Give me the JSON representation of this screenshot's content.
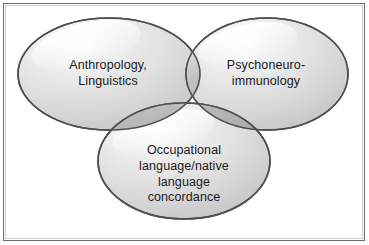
{
  "figure": {
    "type": "venn-diagram-3-set",
    "background_color": "#ffffff",
    "border_color": "#6e6e6e",
    "text_color": "#1a1a1a",
    "fill_light": "#e2e2e2",
    "fill_mid": "#c9c9c9",
    "fill_dark": "#9a9a9a",
    "outline_color": "#4a4a4a",
    "highlight_color": "#ffffff"
  },
  "sets": [
    {
      "id": "anthropology-linguistics",
      "position": "top-left",
      "label": "Anthropology,\nLinguistics",
      "lines": [
        "Anthropology,",
        "Linguistics"
      ]
    },
    {
      "id": "psychoneuroimmunology",
      "position": "top-right",
      "label": "Psychoneuro-\nimmunology",
      "lines": [
        "Psychoneuro-",
        "immunology"
      ]
    },
    {
      "id": "occupational-native-language-concordance",
      "position": "bottom-center",
      "label": "Occupational\nlanguage/native\nlanguage\nconcordance",
      "lines": [
        "Occupational",
        "language/native",
        "language",
        "concordance"
      ]
    }
  ],
  "overlaps": [
    {
      "id": "left-right",
      "sets": [
        "anthropology-linguistics",
        "psychoneuroimmunology"
      ],
      "label": ""
    },
    {
      "id": "left-bottom",
      "sets": [
        "anthropology-linguistics",
        "occupational-native-language-concordance"
      ],
      "label": ""
    },
    {
      "id": "right-bottom",
      "sets": [
        "psychoneuroimmunology",
        "occupational-native-language-concordance"
      ],
      "label": ""
    },
    {
      "id": "center-all",
      "sets": [
        "anthropology-linguistics",
        "psychoneuroimmunology",
        "occupational-native-language-concordance"
      ],
      "label": ""
    }
  ]
}
